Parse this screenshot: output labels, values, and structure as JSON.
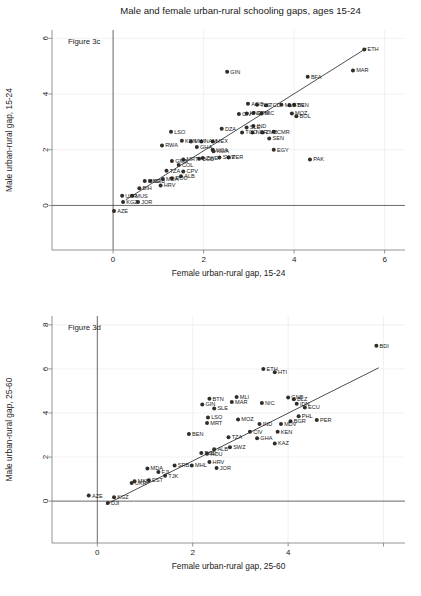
{
  "figure": {
    "title": "Male and female urban-rural schooling gaps, ages 15-24"
  },
  "chart_data": [
    {
      "type": "scatter",
      "panel_id": "figure-3c",
      "annotation": "Figure 3c",
      "title": "Male and female urban-rural schooling gaps, ages 15-24",
      "xlabel": "Female urban-rural gap, 15-24",
      "ylabel": "Male urban-rural gap, 15-24",
      "xlim": [
        -1.35,
        6.45
      ],
      "ylim": [
        -1.6,
        6.3
      ],
      "xticks": [
        0,
        2,
        4,
        6
      ],
      "yticks": [
        0,
        2,
        4,
        6
      ],
      "grid": true,
      "reference_lines": {
        "horizontal_at_y": 0,
        "vertical_at_x": 0
      },
      "fit_line": {
        "x": [
          0.28,
          5.6
        ],
        "y": [
          0.2,
          5.65
        ]
      },
      "legend": "none",
      "points": [
        {
          "label": "ETH",
          "x": 5.55,
          "y": 5.6
        },
        {
          "label": "MAR",
          "x": 5.3,
          "y": 4.85
        },
        {
          "label": "BFA",
          "x": 4.3,
          "y": 4.62
        },
        {
          "label": "GIN",
          "x": 2.52,
          "y": 4.8
        },
        {
          "label": "PAK",
          "x": 4.35,
          "y": 1.65
        },
        {
          "label": "EGY",
          "x": 3.55,
          "y": 2.0
        },
        {
          "label": "CMR",
          "x": 3.55,
          "y": 2.65
        },
        {
          "label": "SEN",
          "x": 3.45,
          "y": 2.4
        },
        {
          "label": "MOZ",
          "x": 3.95,
          "y": 3.3
        },
        {
          "label": "BOL",
          "x": 4.05,
          "y": 3.2
        },
        {
          "label": "BEN",
          "x": 4.0,
          "y": 3.62
        },
        {
          "label": "BTN",
          "x": 3.9,
          "y": 3.6
        },
        {
          "label": "MLI",
          "x": 3.72,
          "y": 3.62
        },
        {
          "label": "TCD",
          "x": 3.38,
          "y": 3.6
        },
        {
          "label": "TLS",
          "x": 3.18,
          "y": 3.62
        },
        {
          "label": "AGO",
          "x": 2.98,
          "y": 3.65
        },
        {
          "label": "NIC",
          "x": 3.28,
          "y": 3.3
        },
        {
          "label": "GTM",
          "x": 3.1,
          "y": 3.32
        },
        {
          "label": "HND",
          "x": 2.95,
          "y": 3.3
        },
        {
          "label": "CIV",
          "x": 2.78,
          "y": 3.28
        },
        {
          "label": "IND",
          "x": 3.1,
          "y": 2.85
        },
        {
          "label": "SLE",
          "x": 2.95,
          "y": 2.8
        },
        {
          "label": "ZMB",
          "x": 3.3,
          "y": 2.62
        },
        {
          "label": "NER",
          "x": 3.08,
          "y": 2.62
        },
        {
          "label": "TGO",
          "x": 2.85,
          "y": 2.62
        },
        {
          "label": "DZA",
          "x": 2.4,
          "y": 2.75
        },
        {
          "label": "LSO",
          "x": 1.28,
          "y": 2.65
        },
        {
          "label": "KEN",
          "x": 1.52,
          "y": 2.32
        },
        {
          "label": "RWA",
          "x": 1.08,
          "y": 2.15
        },
        {
          "label": "MEX",
          "x": 2.2,
          "y": 2.3
        },
        {
          "label": "NAM",
          "x": 1.95,
          "y": 2.3
        },
        {
          "label": "MWI",
          "x": 1.72,
          "y": 2.3
        },
        {
          "label": "GHA",
          "x": 1.85,
          "y": 2.1
        },
        {
          "label": "UGA",
          "x": 2.2,
          "y": 2.0
        },
        {
          "label": "NGA",
          "x": 2.22,
          "y": 1.95
        },
        {
          "label": "PER",
          "x": 2.55,
          "y": 1.72
        },
        {
          "label": "ZWE",
          "x": 1.98,
          "y": 1.7
        },
        {
          "label": "SWZ",
          "x": 2.35,
          "y": 1.72
        },
        {
          "label": "BGD",
          "x": 1.9,
          "y": 1.68
        },
        {
          "label": "MRT",
          "x": 1.55,
          "y": 1.65
        },
        {
          "label": "GMB",
          "x": 1.3,
          "y": 1.6
        },
        {
          "label": "COL",
          "x": 1.45,
          "y": 1.45
        },
        {
          "label": "CPV",
          "x": 1.55,
          "y": 1.22
        },
        {
          "label": "TZA",
          "x": 1.18,
          "y": 1.25
        },
        {
          "label": "ALB",
          "x": 1.5,
          "y": 1.05
        },
        {
          "label": "ROU",
          "x": 1.3,
          "y": 0.98
        },
        {
          "label": "MDA",
          "x": 1.1,
          "y": 0.95
        },
        {
          "label": "HRV",
          "x": 1.05,
          "y": 0.72
        },
        {
          "label": "SRB",
          "x": 0.82,
          "y": 0.88
        },
        {
          "label": "MKD",
          "x": 0.7,
          "y": 0.88
        },
        {
          "label": "BIH",
          "x": 0.58,
          "y": 0.62
        },
        {
          "label": "MUS",
          "x": 0.42,
          "y": 0.35
        },
        {
          "label": "UKR",
          "x": 0.2,
          "y": 0.35
        },
        {
          "label": "JOR",
          "x": 0.55,
          "y": 0.12
        },
        {
          "label": "KGZ",
          "x": 0.22,
          "y": 0.12
        },
        {
          "label": "AZE",
          "x": 0.02,
          "y": -0.2
        }
      ]
    },
    {
      "type": "scatter",
      "panel_id": "figure-3d",
      "annotation": "Figure 3d",
      "title": "",
      "xlabel": "Female urban-rural gap, 25-60",
      "ylabel": "Male urban-rural gap, 25-60",
      "xlim": [
        -0.95,
        6.45
      ],
      "ylim": [
        -1.9,
        8.4
      ],
      "xticks": [
        0,
        2,
        4,
        6
      ],
      "xtick_labels": [
        "0",
        "2",
        "4",
        ""
      ],
      "yticks": [
        0,
        2,
        4,
        6,
        8
      ],
      "grid": true,
      "reference_lines": {
        "horizontal_at_y": 0,
        "vertical_at_x": 0
      },
      "fit_line": {
        "x": [
          0.18,
          5.9
        ],
        "y": [
          -0.15,
          6.05
        ]
      },
      "legend": "none",
      "points": [
        {
          "label": "BDI",
          "x": 5.85,
          "y": 7.05
        },
        {
          "label": "ETH",
          "x": 3.48,
          "y": 6.0
        },
        {
          "label": "HTI",
          "x": 3.72,
          "y": 5.85
        },
        {
          "label": "BTN",
          "x": 2.35,
          "y": 4.65
        },
        {
          "label": "MLI",
          "x": 2.92,
          "y": 4.72
        },
        {
          "label": "MAR",
          "x": 2.82,
          "y": 4.5
        },
        {
          "label": "GIN",
          "x": 2.2,
          "y": 4.38
        },
        {
          "label": "SLE",
          "x": 2.45,
          "y": 4.2
        },
        {
          "label": "NIC",
          "x": 3.45,
          "y": 4.45
        },
        {
          "label": "GNB",
          "x": 4.0,
          "y": 4.7
        },
        {
          "label": "BLZ",
          "x": 4.12,
          "y": 4.62
        },
        {
          "label": "IDN",
          "x": 4.18,
          "y": 4.42
        },
        {
          "label": "ECU",
          "x": 4.35,
          "y": 4.25
        },
        {
          "label": "LSO",
          "x": 2.32,
          "y": 3.8
        },
        {
          "label": "MRT",
          "x": 2.3,
          "y": 3.55
        },
        {
          "label": "MOZ",
          "x": 2.95,
          "y": 3.7
        },
        {
          "label": "IND",
          "x": 3.4,
          "y": 3.5
        },
        {
          "label": "MDV",
          "x": 3.85,
          "y": 3.5
        },
        {
          "label": "BGR",
          "x": 4.05,
          "y": 3.62
        },
        {
          "label": "PER",
          "x": 4.6,
          "y": 3.68
        },
        {
          "label": "PHL",
          "x": 4.22,
          "y": 3.85
        },
        {
          "label": "BEN",
          "x": 1.92,
          "y": 3.05
        },
        {
          "label": "KEN",
          "x": 3.78,
          "y": 3.15
        },
        {
          "label": "CIV",
          "x": 3.2,
          "y": 3.15
        },
        {
          "label": "TZA",
          "x": 2.75,
          "y": 2.9
        },
        {
          "label": "GHA",
          "x": 3.35,
          "y": 2.85
        },
        {
          "label": "KAZ",
          "x": 3.72,
          "y": 2.62
        },
        {
          "label": "SWZ",
          "x": 2.78,
          "y": 2.45
        },
        {
          "label": "ALB",
          "x": 2.45,
          "y": 2.35
        },
        {
          "label": "BGD",
          "x": 2.18,
          "y": 2.18
        },
        {
          "label": "ROU",
          "x": 2.3,
          "y": 2.15
        },
        {
          "label": "HRV",
          "x": 2.35,
          "y": 1.78
        },
        {
          "label": "JOR",
          "x": 2.5,
          "y": 1.5
        },
        {
          "label": "MHL",
          "x": 1.98,
          "y": 1.62
        },
        {
          "label": "SRB",
          "x": 1.62,
          "y": 1.62
        },
        {
          "label": "FJI",
          "x": 1.28,
          "y": 1.32
        },
        {
          "label": "TJK",
          "x": 1.42,
          "y": 1.15
        },
        {
          "label": "EST",
          "x": 1.08,
          "y": 0.95
        },
        {
          "label": "MDA",
          "x": 1.05,
          "y": 1.48
        },
        {
          "label": "UKR",
          "x": 0.72,
          "y": 0.82
        },
        {
          "label": "MKD",
          "x": 0.78,
          "y": 0.9
        },
        {
          "label": "KGZ",
          "x": 0.35,
          "y": 0.18
        },
        {
          "label": "AZE",
          "x": -0.18,
          "y": 0.25
        },
        {
          "label": "DJI",
          "x": 0.22,
          "y": -0.08
        }
      ]
    }
  ]
}
